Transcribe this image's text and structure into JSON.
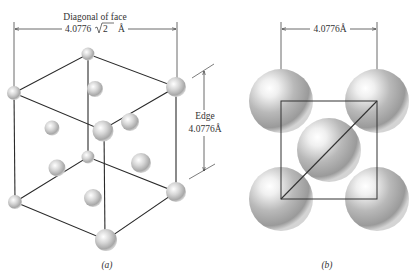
{
  "panel_a": {
    "caption": "(a)",
    "diagonal_title": "Diagonal of face",
    "diagonal_value": "4.0776",
    "diagonal_sqrt": "2",
    "diagonal_unit": "Å",
    "edge_title": "Edge",
    "edge_value": "4.0776Å"
  },
  "panel_b": {
    "caption": "(b)",
    "edge_value": "4.0776Å"
  },
  "colors": {
    "line": "#2a2a2a",
    "sphere_light": "#ffffff",
    "sphere_mid": "#c8c8c8",
    "sphere_dark": "#8a8a8a"
  }
}
